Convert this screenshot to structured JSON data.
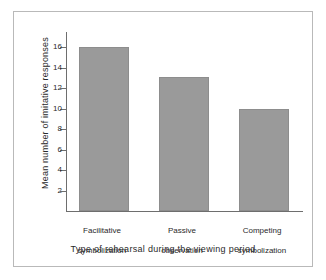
{
  "chart_data": {
    "type": "bar",
    "title": "",
    "subtitle": "",
    "xlabel": "Type of rehearsal during the viewing period",
    "ylabel": "Mean number of imitative responses",
    "categories": [
      "Facilitative\nsymbolization",
      "Passive\nobservation",
      "Competing\nsymbolization"
    ],
    "category_lines": [
      [
        "Facilitative",
        "symbolization"
      ],
      [
        "Passive",
        "observation"
      ],
      [
        "Competing",
        "symbolization"
      ]
    ],
    "values": [
      16.0,
      13.1,
      10.0
    ],
    "ylim": [
      0,
      17.5
    ],
    "yticks": [
      2,
      4,
      6,
      8,
      10,
      12,
      14,
      16
    ],
    "ytick_labels": [
      "2",
      "4",
      "6",
      "8",
      "10",
      "12",
      "14",
      "16"
    ],
    "grid": false,
    "legend": null,
    "legend_position": "none",
    "bar_color": "#9a9a9a",
    "bar_edge_color": "#8d8d8d",
    "axis_color": "#6e6e6e",
    "frame_color": "#b9b9b9",
    "background_color": "#ffffff"
  },
  "figure": {
    "caption": ""
  }
}
